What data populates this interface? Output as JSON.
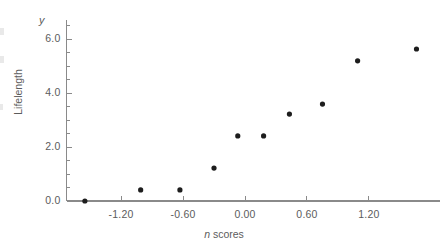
{
  "chart_data": {
    "type": "scatter",
    "title": "",
    "xlabel": "n scores",
    "ylabel": "Lifelength",
    "xlim": [
      -1.85,
      1.87
    ],
    "ylim": [
      -0.05,
      6.55
    ],
    "grid": false,
    "legend": null,
    "xticks": [
      "-1.20",
      "-0.60",
      "0.00",
      "0.60",
      "1.20"
    ],
    "xtick_values": [
      -1.2,
      -0.6,
      0.0,
      0.6,
      1.2
    ],
    "yticks": [
      "0.0",
      "2.0",
      "4.0",
      "6.0"
    ],
    "ytick_values": [
      0.0,
      2.0,
      4.0,
      6.0
    ],
    "minor_tick_step_y": 0.5,
    "minor_tick_step_x": 0.3,
    "marker": "filled-circle",
    "marker_color": "#1d1d1d",
    "axis_color": "#8a8a8a",
    "points": [
      {
        "x": -1.55,
        "y": 0.0
      },
      {
        "x": -1.01,
        "y": 0.41
      },
      {
        "x": -0.63,
        "y": 0.41
      },
      {
        "x": -0.3,
        "y": 1.22
      },
      {
        "x": -0.07,
        "y": 2.41
      },
      {
        "x": 0.18,
        "y": 2.41
      },
      {
        "x": 0.43,
        "y": 3.22
      },
      {
        "x": 0.75,
        "y": 3.59
      },
      {
        "x": 1.09,
        "y": 5.19
      },
      {
        "x": 1.66,
        "y": 5.63
      }
    ],
    "x_values": [
      -1.55,
      -1.01,
      -0.63,
      -0.3,
      -0.07,
      0.18,
      0.43,
      0.75,
      1.09,
      1.66
    ],
    "y_values": [
      0.0,
      0.41,
      0.41,
      1.22,
      2.41,
      2.41,
      3.22,
      3.59,
      5.19,
      5.63
    ]
  },
  "axes": {
    "y_symbol": "y",
    "x_title_italic": "n",
    "x_title_rest": " scores",
    "y_title": "Lifelength"
  }
}
